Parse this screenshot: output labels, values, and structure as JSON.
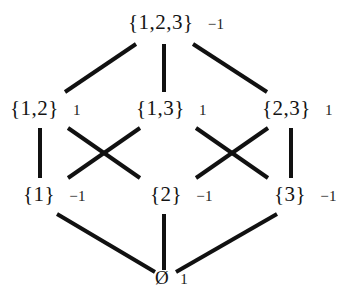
{
  "figure": {
    "background_color": "#ffffff",
    "line_color": "#111111",
    "text_color": "#141414"
  },
  "nodes": [
    {
      "id": "full",
      "label": "{1,2,3}",
      "value": "−1",
      "rank": 3,
      "x": 164,
      "y": 22
    },
    {
      "id": "s12",
      "label": "{1,2}",
      "value": "1",
      "rank": 2,
      "x": 42,
      "y": 108
    },
    {
      "id": "s13",
      "label": "{1,3}",
      "value": "1",
      "rank": 2,
      "x": 165,
      "y": 108
    },
    {
      "id": "s23",
      "label": "{2,3}",
      "value": "1",
      "rank": 2,
      "x": 291,
      "y": 108
    },
    {
      "id": "s1",
      "label": "{1}",
      "value": "−1",
      "rank": 1,
      "x": 41,
      "y": 194
    },
    {
      "id": "s2",
      "label": "{2}",
      "value": "−1",
      "rank": 1,
      "x": 167,
      "y": 194
    },
    {
      "id": "s3",
      "label": "{3}",
      "value": "−1",
      "rank": 1,
      "x": 290,
      "y": 194
    },
    {
      "id": "empty",
      "label": "Ø",
      "value": "1",
      "rank": 0,
      "x": 164,
      "y": 278
    }
  ],
  "edges": [
    {
      "from": "s12",
      "to": "full"
    },
    {
      "from": "s13",
      "to": "full"
    },
    {
      "from": "s23",
      "to": "full"
    },
    {
      "from": "s1",
      "to": "s12"
    },
    {
      "from": "s2",
      "to": "s12"
    },
    {
      "from": "s1",
      "to": "s13"
    },
    {
      "from": "s3",
      "to": "s13"
    },
    {
      "from": "s2",
      "to": "s23"
    },
    {
      "from": "s3",
      "to": "s23"
    },
    {
      "from": "empty",
      "to": "s1"
    },
    {
      "from": "empty",
      "to": "s2"
    },
    {
      "from": "empty",
      "to": "s3"
    }
  ],
  "labels": {
    "full_set": "{1,2,3}",
    "full_set_value": "−1",
    "set_12": "{1,2}",
    "set_12_value": "1",
    "set_13": "{1,3}",
    "set_13_value": "1",
    "set_23": "{2,3}",
    "set_23_value": "1",
    "set_1": "{1}",
    "set_1_value": "−1",
    "set_2": "{2}",
    "set_2_value": "−1",
    "set_3": "{3}",
    "set_3_value": "−1",
    "empty_set": "Ø",
    "empty_set_value": "1"
  }
}
